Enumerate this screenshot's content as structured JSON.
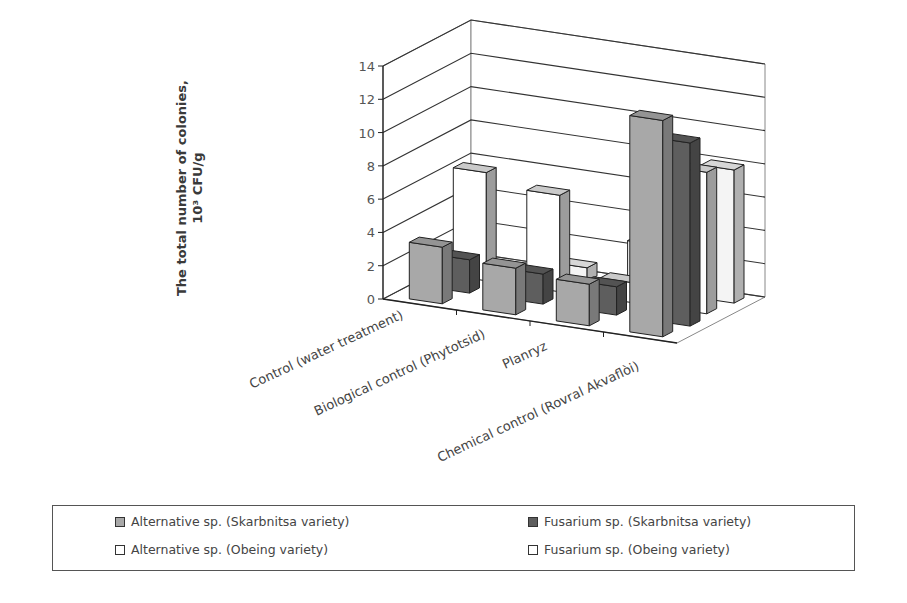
{
  "chart_data": {
    "type": "bar",
    "subtype": "3d-clustered-column",
    "title": "",
    "xlabel": "",
    "ylabel": "The total number of colonies, 10³ CFU/g",
    "ylabel_lines": [
      "The total number of colonies,",
      "10³ CFU/g"
    ],
    "ylim": [
      0,
      14
    ],
    "yticks": [
      0,
      2,
      4,
      6,
      8,
      10,
      12,
      14
    ],
    "grid": true,
    "legend_position": "bottom",
    "categories": [
      "Control (water treatment)",
      "Biological control (Phytotsid)",
      "Planryz",
      "Chemical control (Rovral Akvaflòi)"
    ],
    "series": [
      {
        "name": "Alternative sp. (Skarbnitsa variety)",
        "color": "#a8a8a8",
        "values": [
          3.4,
          2.8,
          2.5,
          13.0
        ]
      },
      {
        "name": "Fusarium sp. (Skarbnitsa variety)",
        "color": "#5e5e5e",
        "values": [
          2.0,
          1.8,
          1.7,
          11.0
        ]
      },
      {
        "name": "Alternative sp. (Obeing variety)",
        "color": "#ffffff",
        "values": [
          6.5,
          5.8,
          1.2,
          8.5
        ]
      },
      {
        "name": "Fusarium sp. (Obeing variety)",
        "color": "#f4f4f4",
        "values": [
          0.1,
          0.8,
          2.8,
          8.0
        ]
      }
    ]
  },
  "legend": {
    "items": [
      {
        "label": "Alternative sp. (Skarbnitsa variety)",
        "color": "#a8a8a8"
      },
      {
        "label": "Fusarium sp. (Skarbnitsa variety)",
        "color": "#5e5e5e"
      },
      {
        "label": "Alternative sp. (Obeing variety)",
        "color": "#ffffff"
      },
      {
        "label": "Fusarium sp. (Obeing variety)",
        "color": "#ffffff"
      }
    ]
  }
}
